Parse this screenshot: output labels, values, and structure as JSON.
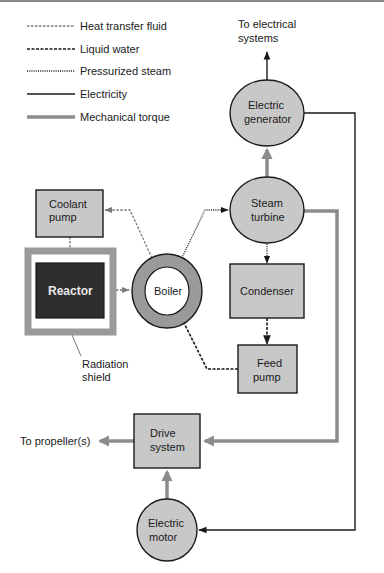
{
  "legend": [
    {
      "label": "Heat transfer fluid",
      "style": "gray-dashed"
    },
    {
      "label": "Liquid water",
      "style": "black-dashed"
    },
    {
      "label": "Pressurized steam",
      "style": "black-dotted"
    },
    {
      "label": "Electricity",
      "style": "black-solid"
    },
    {
      "label": "Mechanical torque",
      "style": "gray-thick"
    }
  ],
  "nodes": {
    "electric_generator": {
      "line1": "Electric",
      "line2": "generator"
    },
    "steam_turbine": {
      "line1": "Steam",
      "line2": "turbine"
    },
    "coolant_pump": {
      "line1": "Coolant",
      "line2": "pump"
    },
    "reactor": {
      "label": "Reactor"
    },
    "boiler": {
      "label": "Boiler"
    },
    "condenser": {
      "label": "Condenser"
    },
    "feed_pump": {
      "line1": "Feed",
      "line2": "pump"
    },
    "drive_system": {
      "line1": "Drive",
      "line2": "system"
    },
    "electric_motor": {
      "line1": "Electric",
      "line2": "motor"
    }
  },
  "annotations": {
    "to_electrical_line1": "To electrical",
    "to_electrical_line2": "systems",
    "radiation_shield_line1": "Radiation",
    "radiation_shield_line2": "shield",
    "to_propellers": "To propeller(s)"
  },
  "colors": {
    "node_fill": "#c8c8c8",
    "reactor_fill": "#2e2e2e",
    "shield_gray": "#9a9a9a",
    "torque_gray": "#8c8c8c",
    "heat_fluid_gray": "#7a7a7a",
    "stroke": "#1a1a1a"
  }
}
